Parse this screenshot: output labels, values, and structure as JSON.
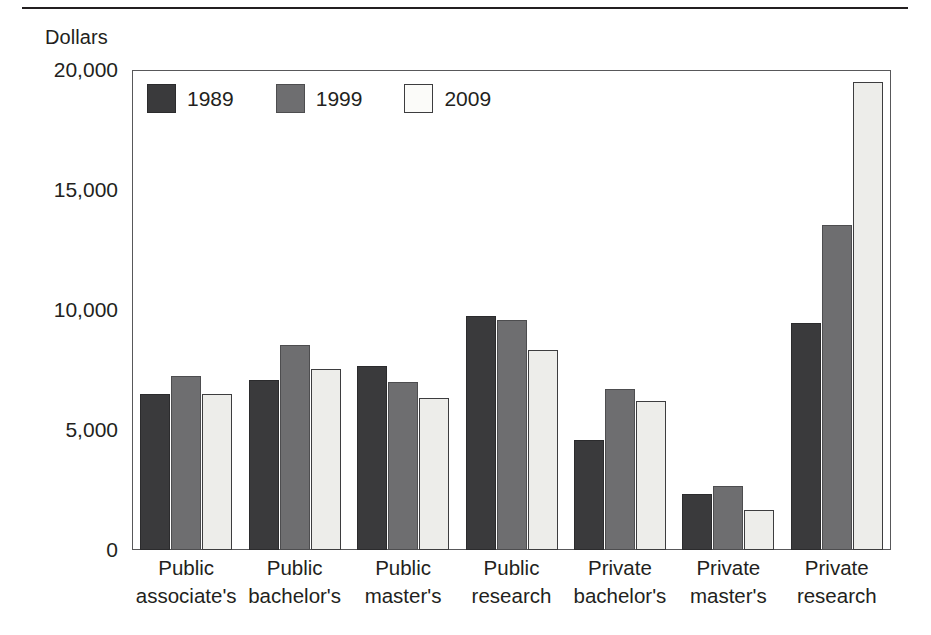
{
  "chart_data": {
    "type": "bar",
    "title": "",
    "subtitle": "",
    "xlabel": "",
    "ylabel": "Dollars",
    "ylim": [
      0,
      20000
    ],
    "ytick_labels": [
      "20,000",
      "15,000",
      "10,000",
      "5,000",
      "0"
    ],
    "yticks": [
      20000,
      15000,
      10000,
      5000,
      0
    ],
    "grid": false,
    "legend_position": "top-left",
    "categories": [
      "Public associate's",
      "Public bachelor's",
      "Public master's",
      "Public research",
      "Private bachelor's",
      "Private master's",
      "Private research"
    ],
    "category_lines": [
      [
        "Public",
        "associate's"
      ],
      [
        "Public",
        "bachelor's"
      ],
      [
        "Public",
        "master's"
      ],
      [
        "Public",
        "research"
      ],
      [
        "Private",
        "bachelor's"
      ],
      [
        "Private",
        "master's"
      ],
      [
        "Private",
        "research"
      ]
    ],
    "series": [
      {
        "name": "1989",
        "color": "#3a3a3c",
        "values": [
          6500,
          7100,
          7650,
          9750,
          4600,
          2350,
          9450
        ]
      },
      {
        "name": "1999",
        "color": "#6e6e70",
        "values": [
          7250,
          8550,
          7000,
          9600,
          6700,
          2650,
          13550
        ]
      },
      {
        "name": "2009",
        "color": "#ededea",
        "values": [
          6500,
          7550,
          6350,
          8350,
          6200,
          1650,
          19500
        ]
      }
    ]
  },
  "legend": {
    "items": [
      {
        "label": "1989",
        "swatch_class": "s1989"
      },
      {
        "label": "1999",
        "swatch_class": "s1999"
      },
      {
        "label": "2009",
        "swatch_class": "s2009"
      }
    ]
  },
  "axis": {
    "y_title": "Dollars"
  }
}
